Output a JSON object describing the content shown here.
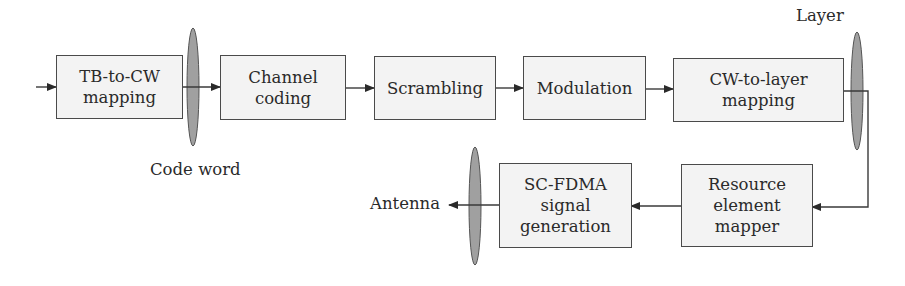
{
  "diagram": {
    "blocks": [
      {
        "id": "tb-to-cw",
        "label": "TB-to-CW\nmapping"
      },
      {
        "id": "channel-coding",
        "label": "Channel\ncoding"
      },
      {
        "id": "scrambling",
        "label": "Scrambling"
      },
      {
        "id": "modulation",
        "label": "Modulation"
      },
      {
        "id": "cw-to-layer",
        "label": "CW-to-layer\nmapping"
      },
      {
        "id": "resource-element-mapper",
        "label": "Resource\nelement\nmapper"
      },
      {
        "id": "sc-fdma",
        "label": "SC-FDMA\nsignal\ngeneration"
      }
    ],
    "labels": {
      "code_word": "Code word",
      "layer": "Layer",
      "antenna": "Antenna"
    },
    "colors": {
      "box_fill": "#f3f3f3",
      "box_border": "#4a4a4a",
      "ellipse_fill": "#a0a0a0",
      "line": "#3a3a3a"
    }
  }
}
